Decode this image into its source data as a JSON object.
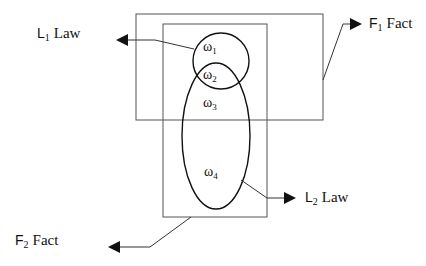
{
  "diagram": {
    "labels": {
      "l1": {
        "letter": "L",
        "sub": "1",
        "word": "Law"
      },
      "l2": {
        "letter": "L",
        "sub": "2",
        "word": "Law"
      },
      "f1": {
        "letter": "F",
        "sub": "1",
        "word": "Fact"
      },
      "f2": {
        "letter": "F",
        "sub": "2",
        "word": "Fact"
      }
    },
    "regions": [
      {
        "symbol": "ω",
        "sub": "1"
      },
      {
        "symbol": "ω",
        "sub": "2"
      },
      {
        "symbol": "ω",
        "sub": "3"
      },
      {
        "symbol": "ω",
        "sub": "4"
      }
    ],
    "colors": {
      "stroke": "#111111",
      "box_stroke": "#555555",
      "background": "#ffffff"
    }
  }
}
